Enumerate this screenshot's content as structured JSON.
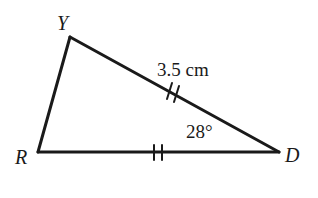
{
  "figure": {
    "kind": "geometry-triangle-diagram",
    "background_color": "#ffffff",
    "stroke_color": "#1a1a1a",
    "text_color": "#1a1a1a",
    "width": 318,
    "height": 198
  },
  "vertices": [
    {
      "id": "Y",
      "label": "Y",
      "x": 70,
      "y": 37
    },
    {
      "id": "R",
      "label": "R",
      "x": 38,
      "y": 152
    },
    {
      "id": "D",
      "label": "D",
      "x": 279,
      "y": 152
    }
  ],
  "sides": [
    {
      "id": "RY",
      "from": "R",
      "to": "Y",
      "ticks": 0
    },
    {
      "id": "YD",
      "from": "Y",
      "to": "D",
      "ticks": 2,
      "length_label": "3.5 cm"
    },
    {
      "id": "RD",
      "from": "R",
      "to": "D",
      "ticks": 2
    }
  ],
  "labels": {
    "side_yd_length": "3.5 cm",
    "angle_at_d": "28°"
  },
  "angles": [
    {
      "at": "D",
      "measure": "28°"
    }
  ]
}
